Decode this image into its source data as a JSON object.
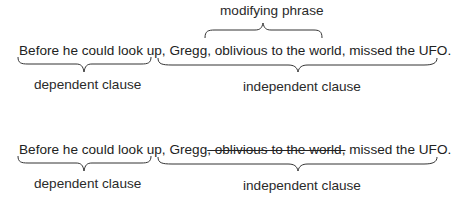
{
  "diagram": {
    "example1": {
      "label_top": "modifying phrase",
      "sentence": {
        "part1": "Before he could look up,",
        "part2": "Gregg, oblivious to the world, missed the UFO."
      },
      "label_left": "dependent clause",
      "label_right": "independent clause"
    },
    "example2": {
      "sentence": {
        "part1": "Before he could look up,",
        "part2a": "Gregg",
        "part2_struck": ", oblivious to the world,",
        "part2b": "missed the UFO."
      },
      "label_left": "dependent clause",
      "label_right": "independent clause"
    },
    "colors": {
      "text": "#222222",
      "brace": "#333333",
      "background": "#ffffff"
    }
  }
}
